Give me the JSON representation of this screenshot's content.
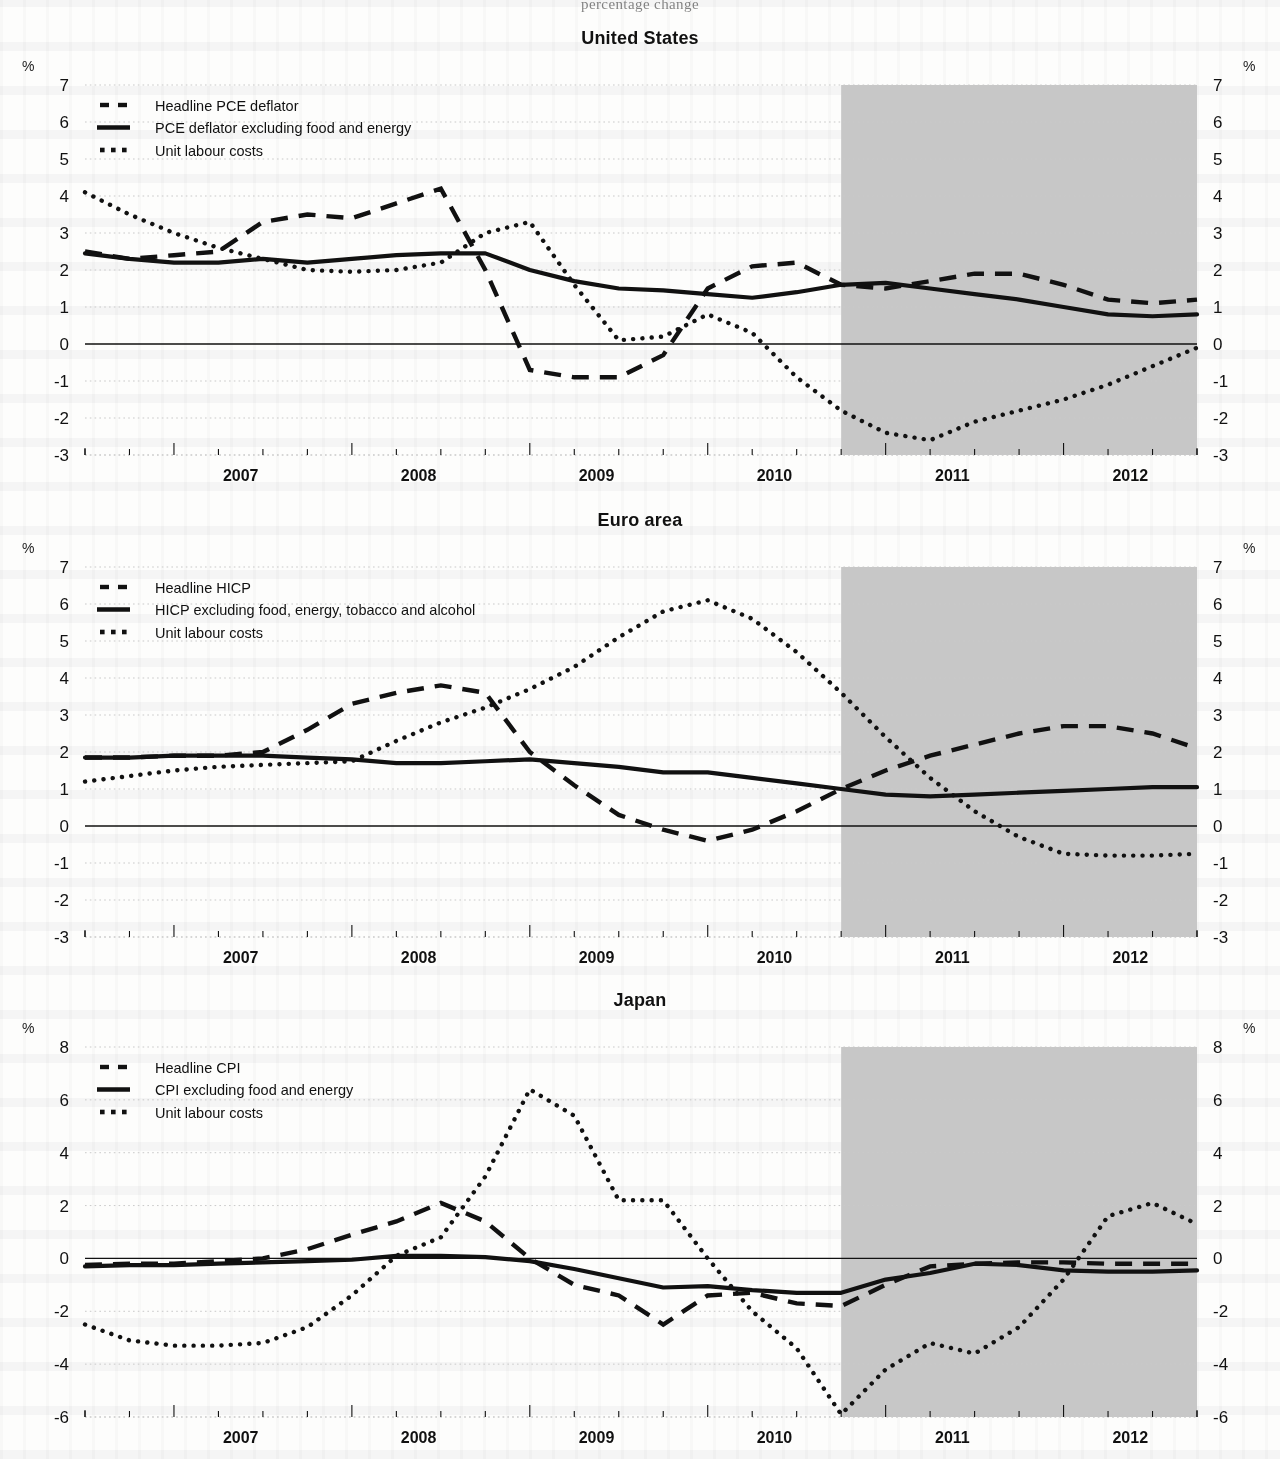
{
  "document": {
    "cut_header": "percentage change"
  },
  "axis": {
    "percent_symbol": "%",
    "x_tick_labels": [
      "2007",
      "2008",
      "2009",
      "2010",
      "2011",
      "2012"
    ],
    "y_labels_standard": [
      "7",
      "6",
      "5",
      "4",
      "3",
      "2",
      "1",
      "0",
      "-1",
      "-2",
      "-3"
    ],
    "y_labels_japan": [
      "8",
      "6",
      "4",
      "2",
      "0",
      "-2",
      "-4",
      "-6"
    ]
  },
  "annotations": {
    "different_scale": "different scale"
  },
  "colors": {
    "ink": "#111111",
    "forecast_shade": "#c7c7c7",
    "gridline": "#c9c9c9",
    "page": "#fdfdfc"
  },
  "panels": [
    {
      "id": "united-states",
      "title": "United States",
      "legend": [
        {
          "label": "Headline PCE deflator",
          "style": "dashed"
        },
        {
          "label": "PCE deflator excluding food and energy",
          "style": "solid"
        },
        {
          "label": "Unit labour costs",
          "style": "dotted"
        }
      ]
    },
    {
      "id": "euro-area",
      "title": "Euro area",
      "legend": [
        {
          "label": "Headline HICP",
          "style": "dashed"
        },
        {
          "label": "HICP excluding food, energy, tobacco and alcohol",
          "style": "solid"
        },
        {
          "label": "Unit labour costs",
          "style": "dotted"
        }
      ]
    },
    {
      "id": "japan",
      "title": "Japan",
      "legend": [
        {
          "label": "Headline CPI",
          "style": "dashed"
        },
        {
          "label": "CPI excluding food and energy",
          "style": "solid"
        },
        {
          "label": "Unit labour costs",
          "style": "dotted"
        }
      ]
    }
  ],
  "chart_data": [
    {
      "type": "line",
      "title": "United States",
      "xlabel": "",
      "ylabel": "%",
      "ylim": [
        -3,
        7
      ],
      "ytick_step": 1,
      "grid": true,
      "legend_position": "top-left",
      "x": [
        "2006Q3",
        "2006Q4",
        "2007Q1",
        "2007Q2",
        "2007Q3",
        "2007Q4",
        "2008Q1",
        "2008Q2",
        "2008Q3",
        "2008Q4",
        "2009Q1",
        "2009Q2",
        "2009Q3",
        "2009Q4",
        "2010Q1",
        "2010Q2",
        "2010Q3",
        "2010Q4",
        "2011Q1",
        "2011Q2",
        "2011Q3",
        "2011Q4",
        "2012Q1",
        "2012Q2",
        "2012Q3",
        "2012Q4"
      ],
      "forecast_starts": "2010Q4",
      "series": [
        {
          "name": "Headline PCE deflator",
          "style": "dashed",
          "values": [
            2.5,
            2.3,
            2.4,
            2.5,
            3.3,
            3.5,
            3.4,
            3.8,
            4.2,
            2.0,
            -0.7,
            -0.9,
            -0.9,
            -0.3,
            1.5,
            2.1,
            2.2,
            1.6,
            1.5,
            1.7,
            1.9,
            1.9,
            1.6,
            1.2,
            1.1,
            1.2
          ]
        },
        {
          "name": "PCE deflator excluding food and energy",
          "style": "solid",
          "values": [
            2.45,
            2.3,
            2.2,
            2.2,
            2.3,
            2.2,
            2.3,
            2.4,
            2.45,
            2.45,
            2.0,
            1.7,
            1.5,
            1.45,
            1.35,
            1.25,
            1.4,
            1.6,
            1.65,
            1.5,
            1.35,
            1.2,
            1.0,
            0.8,
            0.75,
            0.8
          ]
        },
        {
          "name": "Unit labour costs",
          "style": "dotted",
          "values": [
            4.1,
            3.5,
            3.0,
            2.6,
            2.3,
            2.0,
            1.95,
            2.0,
            2.2,
            3.0,
            3.3,
            1.6,
            0.1,
            0.2,
            0.8,
            0.3,
            -0.9,
            -1.8,
            -2.4,
            -2.6,
            -2.1,
            -1.8,
            -1.5,
            -1.1,
            -0.6,
            -0.1
          ]
        }
      ]
    },
    {
      "type": "line",
      "title": "Euro area",
      "xlabel": "",
      "ylabel": "%",
      "ylim": [
        -3,
        7
      ],
      "ytick_step": 1,
      "grid": true,
      "legend_position": "top-left",
      "x": [
        "2006Q3",
        "2006Q4",
        "2007Q1",
        "2007Q2",
        "2007Q3",
        "2007Q4",
        "2008Q1",
        "2008Q2",
        "2008Q3",
        "2008Q4",
        "2009Q1",
        "2009Q2",
        "2009Q3",
        "2009Q4",
        "2010Q1",
        "2010Q2",
        "2010Q3",
        "2010Q4",
        "2011Q1",
        "2011Q2",
        "2011Q3",
        "2011Q4",
        "2012Q1",
        "2012Q2",
        "2012Q3",
        "2012Q4"
      ],
      "forecast_starts": "2010Q4",
      "series": [
        {
          "name": "Headline HICP",
          "style": "dashed",
          "values": [
            1.85,
            1.85,
            1.9,
            1.9,
            2.0,
            2.6,
            3.3,
            3.6,
            3.8,
            3.6,
            2.0,
            1.1,
            0.3,
            -0.1,
            -0.4,
            -0.1,
            0.4,
            1.0,
            1.5,
            1.9,
            2.2,
            2.5,
            2.7,
            2.7,
            2.5,
            2.1
          ]
        },
        {
          "name": "HICP excluding food, energy, tobacco and alcohol",
          "style": "solid",
          "values": [
            1.85,
            1.85,
            1.9,
            1.9,
            1.9,
            1.85,
            1.8,
            1.7,
            1.7,
            1.75,
            1.8,
            1.7,
            1.6,
            1.45,
            1.45,
            1.3,
            1.15,
            1.0,
            0.85,
            0.8,
            0.85,
            0.9,
            0.95,
            1.0,
            1.05,
            1.05
          ]
        },
        {
          "name": "Unit labour costs",
          "style": "dotted",
          "values": [
            1.2,
            1.35,
            1.5,
            1.6,
            1.65,
            1.7,
            1.75,
            2.3,
            2.8,
            3.2,
            3.7,
            4.3,
            5.1,
            5.8,
            6.1,
            5.6,
            4.7,
            3.6,
            2.4,
            1.3,
            0.4,
            -0.3,
            -0.75,
            -0.8,
            -0.8,
            -0.75
          ]
        }
      ]
    },
    {
      "type": "line",
      "title": "Japan",
      "xlabel": "",
      "ylabel": "%",
      "ylim": [
        -6,
        8
      ],
      "ytick_step": 2,
      "grid": true,
      "legend_position": "top-left",
      "annotation": "different scale",
      "x": [
        "2006Q3",
        "2006Q4",
        "2007Q1",
        "2007Q2",
        "2007Q3",
        "2007Q4",
        "2008Q1",
        "2008Q2",
        "2008Q3",
        "2008Q4",
        "2009Q1",
        "2009Q2",
        "2009Q3",
        "2009Q4",
        "2010Q1",
        "2010Q2",
        "2010Q3",
        "2010Q4",
        "2011Q1",
        "2011Q2",
        "2011Q3",
        "2011Q4",
        "2012Q1",
        "2012Q2",
        "2012Q3",
        "2012Q4"
      ],
      "forecast_starts": "2010Q4",
      "series": [
        {
          "name": "Headline CPI",
          "style": "dashed",
          "values": [
            -0.25,
            -0.2,
            -0.2,
            -0.1,
            0.0,
            0.35,
            0.9,
            1.4,
            2.1,
            1.4,
            0.0,
            -1.0,
            -1.4,
            -2.5,
            -1.4,
            -1.3,
            -1.7,
            -1.8,
            -1.0,
            -0.3,
            -0.2,
            -0.15,
            -0.15,
            -0.2,
            -0.2,
            -0.2
          ]
        },
        {
          "name": "CPI excluding food and energy",
          "style": "solid",
          "values": [
            -0.3,
            -0.25,
            -0.25,
            -0.2,
            -0.15,
            -0.1,
            -0.05,
            0.1,
            0.1,
            0.05,
            -0.1,
            -0.4,
            -0.75,
            -1.1,
            -1.05,
            -1.2,
            -1.3,
            -1.3,
            -0.8,
            -0.55,
            -0.2,
            -0.25,
            -0.45,
            -0.5,
            -0.5,
            -0.45
          ]
        },
        {
          "name": "Unit labour costs",
          "style": "dotted",
          "values": [
            -2.5,
            -3.1,
            -3.3,
            -3.3,
            -3.2,
            -2.6,
            -1.4,
            0.1,
            0.8,
            3.1,
            6.4,
            5.4,
            2.2,
            2.2,
            0.0,
            -2.0,
            -3.4,
            -5.9,
            -4.2,
            -3.2,
            -3.6,
            -2.6,
            -0.8,
            1.6,
            2.1,
            1.3
          ]
        }
      ]
    }
  ]
}
